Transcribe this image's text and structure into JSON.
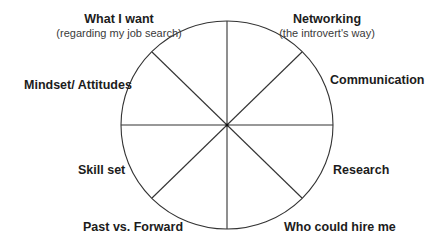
{
  "diagram": {
    "type": "wheel",
    "segments": 8,
    "stroke_color": "#333333",
    "background": "#ffffff",
    "labels": [
      {
        "id": "what-i-want",
        "title": "What I want",
        "subtitle": "(regarding my job search)"
      },
      {
        "id": "networking",
        "title": "Networking",
        "subtitle": "(the introvert's way)"
      },
      {
        "id": "communication",
        "title": "Communication"
      },
      {
        "id": "research",
        "title": "Research"
      },
      {
        "id": "who-could-hire-me",
        "title": "Who could hire me"
      },
      {
        "id": "past-vs-forward",
        "title": "Past vs. Forward"
      },
      {
        "id": "skill-set",
        "title": "Skill set"
      },
      {
        "id": "mindset-attitudes",
        "title": "Mindset/ Attitudes"
      }
    ]
  }
}
